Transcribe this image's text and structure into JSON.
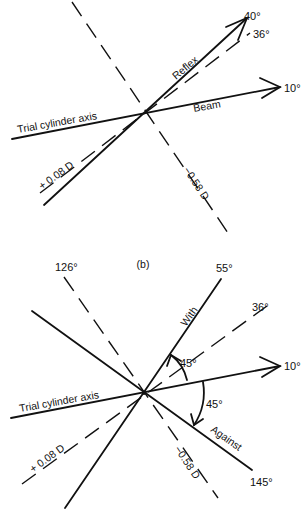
{
  "panel_a": {
    "trial_axis_label": "Trial cylinder axis",
    "beam_label": "Beam",
    "reflex_label": "Reflex",
    "plus_power_label": "+ 0.08 D",
    "minus_power_label": "−0.58 D",
    "angle_40": "40°",
    "angle_36": "36°",
    "angle_10": "10°"
  },
  "caption": "(b)",
  "panel_b": {
    "trial_axis_label": "Trial cylinder axis",
    "with_label": "With",
    "against_label": "Against",
    "plus_power_label": "+ 0.08 D",
    "minus_power_label": "−0.58 D",
    "angle_126": "126°",
    "angle_55": "55°",
    "angle_36": "36°",
    "angle_10": "10°",
    "angle_145": "145°",
    "arc_upper": "45°",
    "arc_lower": "45°"
  }
}
